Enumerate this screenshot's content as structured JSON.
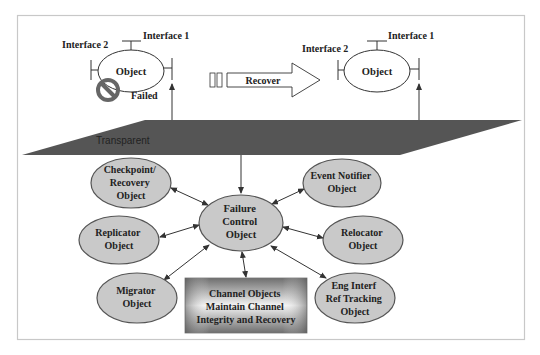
{
  "diagram": {
    "colors": {
      "frame": "#c8c8c8",
      "plane": "#555555",
      "ellipse_fill": "#c9c9c9",
      "ellipse_stroke": "#555555",
      "line": "#333333",
      "failed_icon": "#666666",
      "box_dark": "#7a7a7a",
      "box_light": "#f2f2f2"
    },
    "top_left_object": {
      "label": "Object",
      "interface1": "Interface 1",
      "interface2": "Interface 2",
      "status": "Failed"
    },
    "recover_arrow": {
      "label": "Recover"
    },
    "top_right_object": {
      "label": "Object",
      "interface1": "Interface 1",
      "interface2": "Interface 2"
    },
    "plane": {
      "label": "Transparent"
    },
    "center": {
      "lines": [
        "Failure",
        "Control",
        "Object"
      ]
    },
    "satellites": [
      {
        "id": "checkpoint",
        "lines": [
          "Checkpoint/",
          "Recovery",
          "Object"
        ]
      },
      {
        "id": "replicator",
        "lines": [
          "Replicator",
          "Object"
        ]
      },
      {
        "id": "migrator",
        "lines": [
          "Migrator",
          "Object"
        ]
      },
      {
        "id": "event-notifier",
        "lines": [
          "Event Notifier",
          "Object"
        ]
      },
      {
        "id": "relocator",
        "lines": [
          "Relocator",
          "Object"
        ]
      },
      {
        "id": "eng-interf",
        "lines": [
          "Eng Interf",
          "Ref Tracking",
          "Object"
        ]
      }
    ],
    "channel_box": {
      "lines": [
        "Channel Objects",
        "Maintain Channel",
        "Integrity and Recovery"
      ]
    }
  }
}
